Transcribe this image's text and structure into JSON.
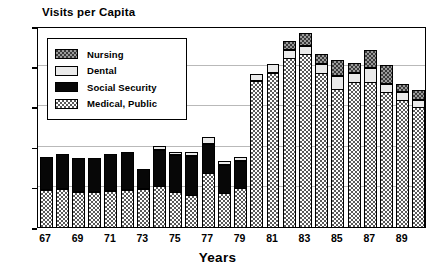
{
  "chart_data": {
    "type": "bar",
    "subtype": "stacked",
    "title": "Visits per Capita",
    "xlabel": "Years",
    "ylabel": "Visits per Capita",
    "ylim": [
      0,
      2.5
    ],
    "ytick_values": [
      0,
      0.5,
      1,
      1.5,
      2,
      2.5
    ],
    "ytick_labels": [
      "0",
      "0.5",
      "1",
      "1.5",
      "2",
      "2.5"
    ],
    "grid": true,
    "grid_axis": "y",
    "legend_position": "upper-left-inside",
    "categories": [
      "67",
      "68",
      "69",
      "70",
      "71",
      "72",
      "73",
      "74",
      "75",
      "76",
      "77",
      "78",
      "79",
      "80",
      "81",
      "82",
      "83",
      "84",
      "85",
      "86",
      "87",
      "88",
      "89",
      "90"
    ],
    "xtick_labels": [
      "67",
      "69",
      "71",
      "73",
      "75",
      "77",
      "79",
      "81",
      "83",
      "85",
      "87",
      "89"
    ],
    "series": [
      {
        "name": "Medical, Public",
        "color": "#8c8c8c",
        "pattern": "checkerboard",
        "values": [
          0.47,
          0.48,
          0.45,
          0.45,
          0.46,
          0.47,
          0.49,
          0.52,
          0.45,
          0.41,
          0.68,
          0.44,
          0.5,
          1.83,
          1.93,
          2.11,
          2.16,
          1.93,
          1.73,
          1.81,
          1.81,
          1.69,
          1.59,
          1.5
        ]
      },
      {
        "name": "Social Security",
        "color": "#070707",
        "pattern": "solid-black",
        "values": [
          0.41,
          0.44,
          0.42,
          0.42,
          0.46,
          0.47,
          0.24,
          0.46,
          0.47,
          0.5,
          0.38,
          0.36,
          0.34,
          0.0,
          0.0,
          0.0,
          0.0,
          0.0,
          0.0,
          0.0,
          0.0,
          0.0,
          0.0,
          0.0
        ]
      },
      {
        "name": "Dental",
        "color": "#eaeaea",
        "pattern": "light-solid",
        "values": [
          0.0,
          0.0,
          0.0,
          0.0,
          0.0,
          0.0,
          0.0,
          0.05,
          0.04,
          0.05,
          0.08,
          0.05,
          0.06,
          0.08,
          0.11,
          0.12,
          0.12,
          0.12,
          0.17,
          0.13,
          0.19,
          0.11,
          0.12,
          0.1
        ]
      },
      {
        "name": "Nursing",
        "color": "#3a3a3a",
        "pattern": "dark-checkerboard",
        "values": [
          0.0,
          0.0,
          0.0,
          0.0,
          0.0,
          0.0,
          0.0,
          0.0,
          0.0,
          0.0,
          0.0,
          0.0,
          0.0,
          0.0,
          0.0,
          0.11,
          0.16,
          0.13,
          0.2,
          0.12,
          0.23,
          0.24,
          0.09,
          0.13
        ]
      }
    ],
    "totals": [
      0.88,
      0.92,
      0.87,
      0.87,
      0.92,
      0.94,
      0.73,
      1.03,
      0.96,
      0.96,
      1.14,
      0.85,
      0.9,
      1.91,
      2.04,
      2.34,
      2.44,
      2.18,
      2.1,
      2.06,
      2.23,
      2.04,
      1.8,
      1.73
    ]
  },
  "legend": {
    "items": [
      {
        "label": "Nursing",
        "swatch": "dark-checkerboard"
      },
      {
        "label": "Dental",
        "swatch": "light-solid"
      },
      {
        "label": "Social Security",
        "swatch": "solid-black"
      },
      {
        "label": "Medical, Public",
        "swatch": "checkerboard"
      }
    ]
  }
}
